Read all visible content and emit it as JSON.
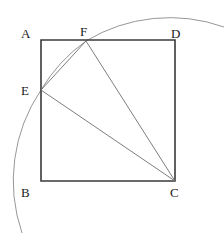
{
  "figure": {
    "background_color": "#ffffff",
    "width": 224,
    "height": 243,
    "square": {
      "name": "square-ABDC",
      "stroke_color": "#3a3a3a",
      "stroke_width": 1.6,
      "fill": "none",
      "corners": {
        "A": {
          "x": 41,
          "y": 40
        },
        "D": {
          "x": 175,
          "y": 40
        },
        "C": {
          "x": 175,
          "y": 181
        },
        "B": {
          "x": 41,
          "y": 181
        }
      },
      "path": "M41 40 L175 40 L175 181 L41 181 Z"
    },
    "points": {
      "E": {
        "x": 41,
        "y": 90,
        "on_segment": "AB"
      },
      "F": {
        "x": 86,
        "y": 41,
        "on_segment": "AD"
      }
    },
    "segments": [
      {
        "name": "segment-EF",
        "from": "E",
        "to": "F",
        "path": "M41 90 L86 41"
      },
      {
        "name": "segment-EC",
        "from": "E",
        "to": "C",
        "path": "M41 90 L175 181"
      },
      {
        "name": "segment-FC",
        "from": "F",
        "to": "C",
        "path": "M86 41 L175 181"
      }
    ],
    "segment_style": {
      "stroke_color": "#6e6e6e",
      "stroke_width": 0.9
    },
    "arc": {
      "name": "arc-centered-at-C",
      "center": {
        "x": 175,
        "y": 181
      },
      "radius": 162,
      "stroke_color": "#8a8a8a",
      "stroke_width": 0.9,
      "fill": "none",
      "path": "M22 233 A162 162 0 0 1 41 90 A162 162 0 0 1 86 41 A162 162 0 0 1 224 27"
    },
    "labels": [
      {
        "id": "A",
        "text": "A",
        "x": 21,
        "y": 27
      },
      {
        "id": "F",
        "text": "F",
        "x": 80,
        "y": 25
      },
      {
        "id": "D",
        "text": "D",
        "x": 171,
        "y": 27
      },
      {
        "id": "E",
        "text": "E",
        "x": 21,
        "y": 84
      },
      {
        "id": "B",
        "text": "B",
        "x": 21,
        "y": 186
      },
      {
        "id": "C",
        "text": "C",
        "x": 170,
        "y": 186
      }
    ]
  }
}
